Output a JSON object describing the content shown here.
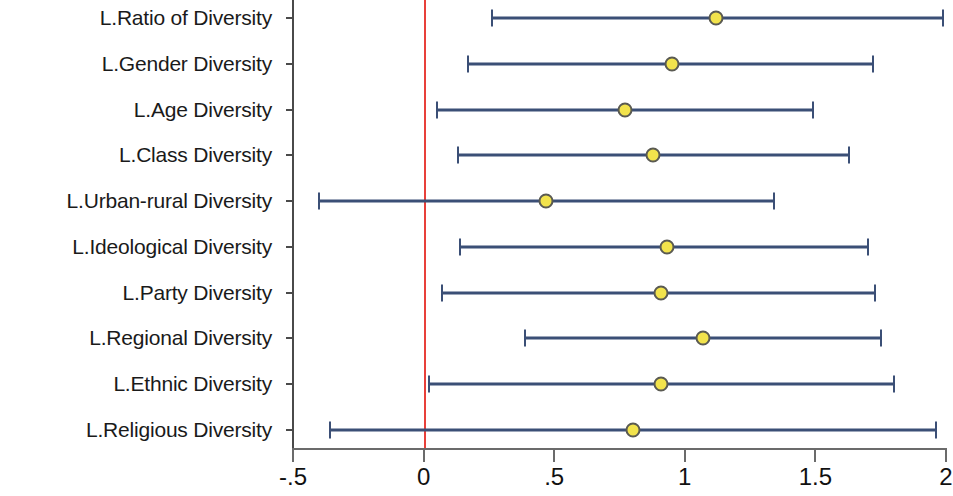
{
  "chart_data": {
    "type": "scatter",
    "title": "",
    "xlabel": "",
    "ylabel": "",
    "xlim": [
      -0.5,
      2.0
    ],
    "grid": false,
    "legend": "none",
    "reference_line": {
      "value": 0,
      "color": "#e8403a"
    },
    "xticks": [
      {
        "value": -0.5,
        "label": "-.5"
      },
      {
        "value": 0,
        "label": "0"
      },
      {
        "value": 0.5,
        "label": ".5"
      },
      {
        "value": 1,
        "label": "1"
      },
      {
        "value": 1.5,
        "label": "1.5"
      },
      {
        "value": 2,
        "label": "2"
      }
    ],
    "categories": [
      "L.Ratio of Diversity",
      "L.Gender Diversity",
      "L.Age Diversity",
      "L.Class Diversity",
      "L.Urban-rural Diversity",
      "L.Ideological Diversity",
      "L.Party Diversity",
      "L.Regional Diversity",
      "L.Ethnic Diversity",
      "L.Religious Diversity"
    ],
    "points": [
      {
        "label": "L.Ratio of Diversity",
        "estimate": 1.12,
        "low": 0.26,
        "high": 1.99
      },
      {
        "label": "L.Gender Diversity",
        "estimate": 0.95,
        "low": 0.17,
        "high": 1.72
      },
      {
        "label": "L.Age Diversity",
        "estimate": 0.77,
        "low": 0.05,
        "high": 1.49
      },
      {
        "label": "L.Class Diversity",
        "estimate": 0.88,
        "low": 0.13,
        "high": 1.63
      },
      {
        "label": "L.Urban-rural Diversity",
        "estimate": 0.47,
        "low": -0.4,
        "high": 1.34
      },
      {
        "label": "L.Ideological Diversity",
        "estimate": 0.93,
        "low": 0.14,
        "high": 1.7
      },
      {
        "label": "L.Party Diversity",
        "estimate": 0.91,
        "low": 0.07,
        "high": 1.73
      },
      {
        "label": "L.Regional Diversity",
        "estimate": 1.07,
        "low": 0.39,
        "high": 1.75
      },
      {
        "label": "L.Ethnic Diversity",
        "estimate": 0.91,
        "low": 0.02,
        "high": 1.8
      },
      {
        "label": "L.Religious Diversity",
        "estimate": 0.8,
        "low": -0.36,
        "high": 1.96
      }
    ],
    "marker": {
      "fill": "#f2e34c",
      "edge": "#5a5a52",
      "shape": "circle"
    },
    "interval_color": "#3b4f76"
  }
}
